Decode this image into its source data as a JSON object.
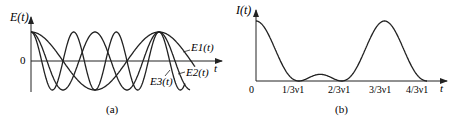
{
  "figure": {
    "panel_a": {
      "caption": "(a)",
      "ylabel": "E(t)",
      "xlabel": "t",
      "zero_label": "0",
      "legend": [
        "E1(t)",
        "E2(t)",
        "E3(t)"
      ]
    },
    "panel_b": {
      "caption": "(b)",
      "ylabel": "I(t)",
      "xlabel": "t",
      "ticks": [
        "0",
        "1/3ν1",
        "2/3ν1",
        "3/3ν1",
        "4/3ν1"
      ]
    }
  },
  "chart_data": [
    {
      "type": "line",
      "title": "(a)",
      "xlabel": "t",
      "ylabel": "E(t)",
      "grid": false,
      "description": "Three cosine waves starting in phase at t=0; E1 frequency ν1, E2 frequency 2ν1, E3 frequency 3ν1; all re-align in phase at t=1/ν1",
      "series": [
        {
          "name": "E1(t)",
          "function": "cos(2π ν1 t)",
          "relative_frequency": 1
        },
        {
          "name": "E2(t)",
          "function": "cos(2π 2ν1 t)",
          "relative_frequency": 2
        },
        {
          "name": "E3(t)",
          "function": "cos(2π 3ν1 t)",
          "relative_frequency": 3
        }
      ],
      "ylim": [
        -1,
        1
      ]
    },
    {
      "type": "line",
      "title": "(b)",
      "xlabel": "t",
      "ylabel": "I(t)",
      "grid": false,
      "categories": [
        "0",
        "1/3ν1",
        "2/3ν1",
        "3/3ν1",
        "4/3ν1"
      ],
      "x": [
        0,
        0.333,
        0.667,
        1.0,
        1.333
      ],
      "description": "Intensity |E1+E2+E3|^2: maximum at t=0 and t=1/ν1, zeros at 1/3ν1, 2/3ν1, 4/3ν1, small secondary lobe between 1/3ν1 and 2/3ν1",
      "key_points": [
        {
          "t": 0,
          "I": 1.0
        },
        {
          "t": 0.333,
          "I": 0
        },
        {
          "t": 0.5,
          "I": 0.15
        },
        {
          "t": 0.667,
          "I": 0
        },
        {
          "t": 1.0,
          "I": 1.0
        },
        {
          "t": 1.333,
          "I": 0
        }
      ]
    }
  ]
}
